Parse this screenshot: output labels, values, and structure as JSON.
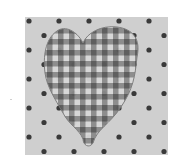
{
  "image": {
    "subject": "fabric swatch with gingham heart on polka-dot background",
    "colors": {
      "page_background": "#ffffff",
      "fabric_background": "#cfcfcf",
      "polka_dot": "#3a3a3a",
      "gingham_dark": "#5a5a5a",
      "gingham_mid": "#8a8a8a",
      "gingham_light": "#d8d8d8"
    }
  }
}
